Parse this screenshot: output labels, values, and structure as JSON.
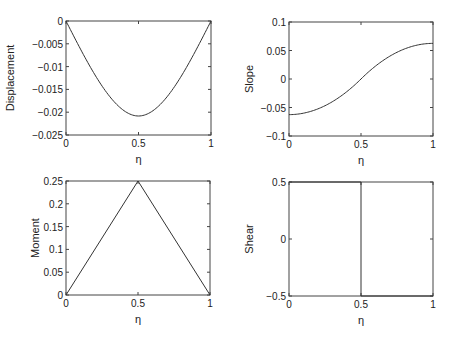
{
  "chart_data": [
    {
      "type": "line",
      "id": "displacement",
      "title": "",
      "xlabel": "η",
      "ylabel": "Displacement",
      "xlim": [
        0,
        1
      ],
      "ylim": [
        -0.025,
        0
      ],
      "xticks": [
        "0",
        "0.5",
        "1"
      ],
      "yticks": [
        "0",
        "-0.005",
        "-0.01",
        "-0.015",
        "-0.02",
        "-0.025"
      ],
      "grid": false,
      "x": [
        0,
        0.1,
        0.2,
        0.3,
        0.4,
        0.5,
        0.6,
        0.7,
        0.8,
        0.9,
        1.0
      ],
      "series": [
        {
          "name": "Displacement",
          "values": [
            0,
            -0.0061,
            -0.0113,
            -0.0155,
            -0.0184,
            -0.0208,
            -0.0184,
            -0.0155,
            -0.0113,
            -0.0061,
            0
          ]
        }
      ]
    },
    {
      "type": "line",
      "id": "slope",
      "title": "",
      "xlabel": "η",
      "ylabel": "Slope",
      "xlim": [
        0,
        1
      ],
      "ylim": [
        -0.1,
        0.1
      ],
      "xticks": [
        "0",
        "0.5",
        "1"
      ],
      "yticks": [
        "0.1",
        "0.05",
        "0",
        "-0.05",
        "-0.1"
      ],
      "grid": false,
      "x": [
        0,
        0.1,
        0.2,
        0.3,
        0.4,
        0.5,
        0.6,
        0.7,
        0.8,
        0.9,
        1.0
      ],
      "series": [
        {
          "name": "Slope",
          "values": [
            -0.0625,
            -0.06,
            -0.0525,
            -0.04,
            -0.0225,
            0,
            0.0225,
            0.04,
            0.0525,
            0.06,
            0.0625
          ]
        }
      ]
    },
    {
      "type": "line",
      "id": "moment",
      "title": "",
      "xlabel": "η",
      "ylabel": "Moment",
      "xlim": [
        0,
        1
      ],
      "ylim": [
        0,
        0.25
      ],
      "xticks": [
        "0",
        "0.5",
        "1"
      ],
      "yticks": [
        "0.25",
        "0.2",
        "0.15",
        "0.1",
        "0.05",
        "0"
      ],
      "grid": false,
      "x": [
        0,
        0.5,
        1
      ],
      "series": [
        {
          "name": "Moment",
          "values": [
            0,
            0.25,
            0
          ]
        }
      ]
    },
    {
      "type": "line",
      "id": "shear",
      "title": "",
      "xlabel": "η",
      "ylabel": "Shear",
      "xlim": [
        0,
        1
      ],
      "ylim": [
        -0.5,
        0.5
      ],
      "xticks": [
        "0",
        "0.5",
        "1"
      ],
      "yticks": [
        "0.5",
        "0",
        "-0.5"
      ],
      "grid": false,
      "x": [
        0,
        0.5,
        0.5,
        1
      ],
      "series": [
        {
          "name": "Shear",
          "values": [
            0.5,
            0.5,
            -0.5,
            -0.5
          ]
        }
      ]
    }
  ]
}
